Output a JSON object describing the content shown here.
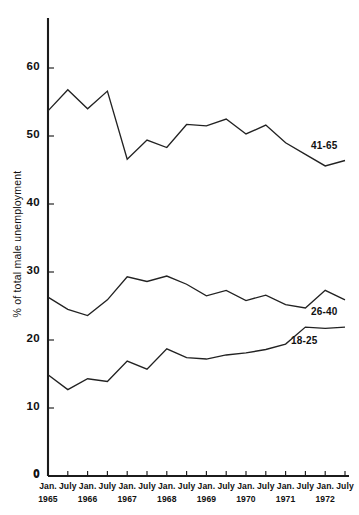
{
  "chart_data": {
    "type": "line",
    "title": "",
    "xlabel": "",
    "ylabel": "% of total male unemployment",
    "ylim": [
      0,
      62
    ],
    "yticks": [
      0,
      10,
      20,
      30,
      40,
      50,
      60
    ],
    "ytick_labels": [
      "0",
      "10",
      "20",
      "30",
      "40",
      "50",
      "60"
    ],
    "grid": false,
    "legend_position": "inline-right",
    "categories": [
      "Jan. 1965",
      "July 1965",
      "Jan. 1966",
      "July 1966",
      "Jan. 1967",
      "July 1967",
      "Jan. 1968",
      "July 1968",
      "Jan. 1969",
      "July 1969",
      "Jan. 1970",
      "July 1970",
      "Jan. 1971",
      "July 1971",
      "Jan. 1972",
      "July 1972"
    ],
    "xtick_labels": [
      "Jan.",
      "July",
      "Jan.",
      "July",
      "Jan.",
      "July",
      "Jan.",
      "July",
      "Jan.",
      "July",
      "Jan.",
      "July",
      "Jan.",
      "July",
      "Jan.",
      "July"
    ],
    "xtick_years": [
      "1965",
      "",
      "1966",
      "",
      "1967",
      "",
      "1968",
      "",
      "1969",
      "",
      "1970",
      "",
      "1971",
      "",
      "1972",
      ""
    ],
    "series": [
      {
        "name": "41-65",
        "label": "41-65",
        "values": [
          53.7,
          56.8,
          54.0,
          56.6,
          46.6,
          49.4,
          48.3,
          51.7,
          51.5,
          52.5,
          50.3,
          51.6,
          49.0,
          47.3,
          45.6,
          46.4
        ]
      },
      {
        "name": "26-40",
        "label": "26-40",
        "values": [
          26.3,
          24.5,
          23.6,
          25.9,
          29.3,
          28.6,
          29.4,
          28.2,
          26.5,
          27.3,
          25.8,
          26.6,
          25.2,
          24.7,
          27.3,
          25.9
        ]
      },
      {
        "name": "18-25",
        "label": "18-25",
        "values": [
          14.9,
          12.7,
          14.3,
          13.9,
          16.9,
          15.7,
          18.7,
          17.4,
          17.2,
          17.8,
          18.1,
          18.6,
          19.4,
          21.9,
          21.7,
          21.9
        ]
      }
    ]
  },
  "axis": {
    "y_axis_title": "% of total male unemployment",
    "zero_label": "0"
  }
}
